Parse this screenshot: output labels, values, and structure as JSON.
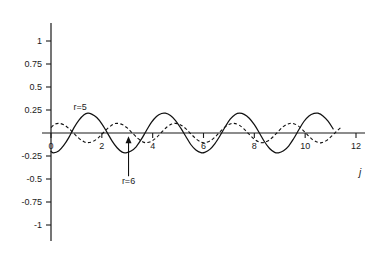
{
  "chart_data": {
    "type": "line",
    "title": "",
    "subtitle": "",
    "xlabel": "j",
    "ylabel": "",
    "xlim": [
      0,
      12
    ],
    "ylim": [
      -1,
      1
    ],
    "grid": false,
    "legend_position": "inline-annotations",
    "x_ticks": [
      "0",
      "2",
      "4",
      "6",
      "8",
      "10",
      "12"
    ],
    "x_tick_values": [
      0,
      2,
      4,
      6,
      8,
      10,
      12
    ],
    "y_ticks": [
      "1",
      "0.75",
      "0.5",
      "0.25",
      "-0.25",
      "-0.5",
      "-0.75",
      "-1"
    ],
    "y_tick_values": [
      1,
      0.75,
      0.5,
      0.25,
      -0.25,
      -0.5,
      -0.75,
      -1
    ],
    "annotations": [
      {
        "name": "r5-label",
        "text": "r=5",
        "x": 1.15,
        "y": 0.255,
        "target_series": "r=5"
      },
      {
        "name": "r6-label",
        "text": "r=6",
        "text_x": 3.05,
        "text_y": -0.55,
        "arrow_from_x": 3.05,
        "arrow_from_y": -0.47,
        "arrow_to_x": 3.05,
        "arrow_to_y": -0.035,
        "target_series": "r=6"
      }
    ],
    "series": [
      {
        "name": "r=5",
        "label": "r=5",
        "style": "solid",
        "color": "#111111",
        "amplitude": 0.215,
        "cycles_over_range": 5,
        "x_start": 0,
        "x_end": 11.1,
        "phase_deg": 180,
        "description": "Solid oscillating curve labelled r=5; about 5 full oscillations between j=0 and j=11, peak value approximately 0.215 and trough approximately -0.215.",
        "points": [
          {
            "x": 0.0,
            "y": -0.2
          },
          {
            "x": 0.1,
            "y": -0.215
          },
          {
            "x": 0.3,
            "y": -0.196
          },
          {
            "x": 0.5,
            "y": -0.135
          },
          {
            "x": 0.7,
            "y": -0.05
          },
          {
            "x": 0.9,
            "y": 0.055
          },
          {
            "x": 1.1,
            "y": 0.14
          },
          {
            "x": 1.3,
            "y": 0.198
          },
          {
            "x": 1.45,
            "y": 0.215
          },
          {
            "x": 1.6,
            "y": 0.205
          },
          {
            "x": 1.8,
            "y": 0.168
          },
          {
            "x": 2.0,
            "y": 0.1
          },
          {
            "x": 2.2,
            "y": 0.01
          },
          {
            "x": 2.4,
            "y": -0.085
          },
          {
            "x": 2.6,
            "y": -0.16
          },
          {
            "x": 2.8,
            "y": -0.208
          },
          {
            "x": 2.95,
            "y": -0.215
          },
          {
            "x": 3.15,
            "y": -0.196
          },
          {
            "x": 3.35,
            "y": -0.15
          },
          {
            "x": 3.55,
            "y": -0.07
          },
          {
            "x": 3.75,
            "y": 0.025
          },
          {
            "x": 3.95,
            "y": 0.115
          },
          {
            "x": 4.15,
            "y": 0.18
          },
          {
            "x": 4.35,
            "y": 0.212
          },
          {
            "x": 4.5,
            "y": 0.215
          },
          {
            "x": 4.7,
            "y": 0.19
          },
          {
            "x": 4.9,
            "y": 0.135
          },
          {
            "x": 5.1,
            "y": 0.055
          },
          {
            "x": 5.3,
            "y": -0.035
          },
          {
            "x": 5.5,
            "y": -0.125
          },
          {
            "x": 5.7,
            "y": -0.185
          },
          {
            "x": 5.9,
            "y": -0.214
          },
          {
            "x": 6.05,
            "y": -0.21
          },
          {
            "x": 6.25,
            "y": -0.178
          },
          {
            "x": 6.45,
            "y": -0.115
          },
          {
            "x": 6.65,
            "y": -0.03
          },
          {
            "x": 6.85,
            "y": 0.065
          },
          {
            "x": 7.05,
            "y": 0.15
          },
          {
            "x": 7.25,
            "y": 0.202
          },
          {
            "x": 7.42,
            "y": 0.215
          },
          {
            "x": 7.6,
            "y": 0.202
          },
          {
            "x": 7.8,
            "y": 0.16
          },
          {
            "x": 8.0,
            "y": 0.09
          },
          {
            "x": 8.2,
            "y": 0.0
          },
          {
            "x": 8.4,
            "y": -0.095
          },
          {
            "x": 8.6,
            "y": -0.168
          },
          {
            "x": 8.8,
            "y": -0.21
          },
          {
            "x": 8.95,
            "y": -0.215
          },
          {
            "x": 9.15,
            "y": -0.193
          },
          {
            "x": 9.35,
            "y": -0.142
          },
          {
            "x": 9.55,
            "y": -0.06
          },
          {
            "x": 9.75,
            "y": 0.035
          },
          {
            "x": 9.95,
            "y": 0.125
          },
          {
            "x": 10.15,
            "y": 0.186
          },
          {
            "x": 10.35,
            "y": 0.213
          },
          {
            "x": 10.5,
            "y": 0.215
          },
          {
            "x": 10.7,
            "y": 0.186
          },
          {
            "x": 10.9,
            "y": 0.128
          },
          {
            "x": 11.1,
            "y": 0.045
          }
        ]
      },
      {
        "name": "r=6",
        "label": "r=6",
        "style": "dashed",
        "color": "#111111",
        "amplitude": 0.105,
        "cycles_over_range": 6,
        "x_start": 0,
        "x_end": 11.4,
        "phase_deg": 0,
        "description": "Dashed oscillating curve labelled r=6; about 6 oscillations between j=0 and j=11, peak value approximately 0.105 and trough approximately -0.105.",
        "points": [
          {
            "x": 0.0,
            "y": 0.06
          },
          {
            "x": 0.15,
            "y": 0.095
          },
          {
            "x": 0.3,
            "y": 0.105
          },
          {
            "x": 0.5,
            "y": 0.09
          },
          {
            "x": 0.7,
            "y": 0.05
          },
          {
            "x": 0.9,
            "y": -0.005
          },
          {
            "x": 1.1,
            "y": -0.058
          },
          {
            "x": 1.3,
            "y": -0.095
          },
          {
            "x": 1.45,
            "y": -0.105
          },
          {
            "x": 1.65,
            "y": -0.092
          },
          {
            "x": 1.85,
            "y": -0.055
          },
          {
            "x": 2.05,
            "y": 0.0
          },
          {
            "x": 2.25,
            "y": 0.055
          },
          {
            "x": 2.45,
            "y": 0.094
          },
          {
            "x": 2.6,
            "y": 0.105
          },
          {
            "x": 2.8,
            "y": 0.092
          },
          {
            "x": 3.0,
            "y": 0.055
          },
          {
            "x": 3.2,
            "y": 0.0
          },
          {
            "x": 3.4,
            "y": -0.055
          },
          {
            "x": 3.6,
            "y": -0.094
          },
          {
            "x": 3.75,
            "y": -0.105
          },
          {
            "x": 3.95,
            "y": -0.09
          },
          {
            "x": 4.15,
            "y": -0.05
          },
          {
            "x": 4.35,
            "y": 0.008
          },
          {
            "x": 4.55,
            "y": 0.062
          },
          {
            "x": 4.75,
            "y": 0.097
          },
          {
            "x": 4.9,
            "y": 0.105
          },
          {
            "x": 5.1,
            "y": 0.088
          },
          {
            "x": 5.3,
            "y": 0.048
          },
          {
            "x": 5.5,
            "y": -0.008
          },
          {
            "x": 5.7,
            "y": -0.062
          },
          {
            "x": 5.9,
            "y": -0.098
          },
          {
            "x": 6.05,
            "y": -0.105
          },
          {
            "x": 6.25,
            "y": -0.088
          },
          {
            "x": 6.45,
            "y": -0.045
          },
          {
            "x": 6.65,
            "y": 0.012
          },
          {
            "x": 6.85,
            "y": 0.066
          },
          {
            "x": 7.05,
            "y": 0.099
          },
          {
            "x": 7.2,
            "y": 0.105
          },
          {
            "x": 7.4,
            "y": 0.086
          },
          {
            "x": 7.6,
            "y": 0.042
          },
          {
            "x": 7.8,
            "y": -0.015
          },
          {
            "x": 8.0,
            "y": -0.068
          },
          {
            "x": 8.2,
            "y": -0.1
          },
          {
            "x": 8.35,
            "y": -0.105
          },
          {
            "x": 8.55,
            "y": -0.084
          },
          {
            "x": 8.75,
            "y": -0.038
          },
          {
            "x": 8.95,
            "y": 0.02
          },
          {
            "x": 9.15,
            "y": 0.072
          },
          {
            "x": 9.35,
            "y": 0.101
          },
          {
            "x": 9.5,
            "y": 0.105
          },
          {
            "x": 9.7,
            "y": 0.082
          },
          {
            "x": 9.9,
            "y": 0.035
          },
          {
            "x": 10.1,
            "y": -0.022
          },
          {
            "x": 10.3,
            "y": -0.074
          },
          {
            "x": 10.5,
            "y": -0.102
          },
          {
            "x": 10.65,
            "y": -0.105
          },
          {
            "x": 10.85,
            "y": -0.08
          },
          {
            "x": 11.05,
            "y": -0.032
          },
          {
            "x": 11.25,
            "y": 0.022
          },
          {
            "x": 11.4,
            "y": 0.06
          }
        ]
      }
    ]
  }
}
